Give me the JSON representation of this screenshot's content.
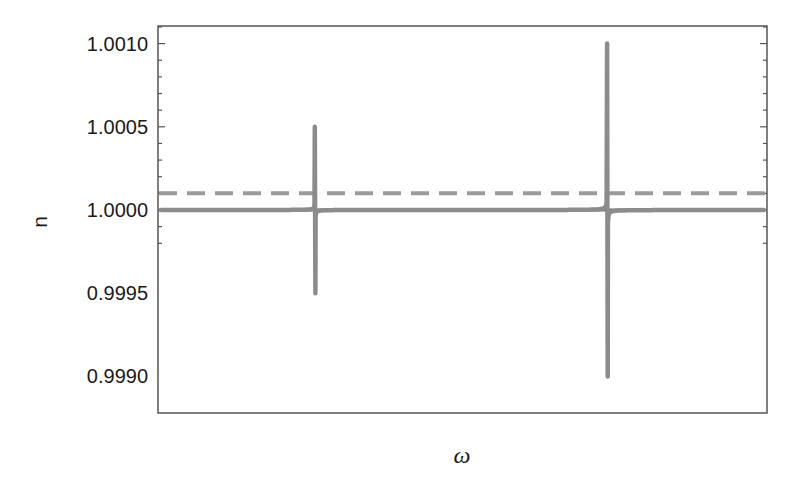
{
  "chart_data": {
    "type": "line",
    "title": "",
    "xlabel": "ω",
    "ylabel": "n",
    "ylim": [
      0.99976,
      1.00112
    ],
    "y_ticks": [
      {
        "value": 1.001,
        "label": "1.0010"
      },
      {
        "value": 1.0005,
        "label": "1.0005"
      },
      {
        "value": 1.0,
        "label": "1.0000"
      },
      {
        "value": 0.9995,
        "label": "0.9995"
      },
      {
        "value": 0.999,
        "label": "0.9990"
      }
    ],
    "x_ticks": [],
    "grid": false,
    "legend": null,
    "series": [
      {
        "name": "refractive index n(ω) with two resonances",
        "style": "solid-thick",
        "color": "#8c8c8c",
        "resonances": [
          {
            "x_fraction": 0.258,
            "peak": 1.0005,
            "trough": 0.9995
          },
          {
            "x_fraction": 0.738,
            "peak": 1.001,
            "trough": 0.999
          }
        ]
      },
      {
        "name": "n = 1 reference",
        "style": "solid",
        "color": "#6e6e6e",
        "value": 1.0
      },
      {
        "name": "threshold level",
        "style": "dashed",
        "color": "#999999",
        "value": 1.0001
      }
    ],
    "annotations": [
      "Shaded region between curve and dashed line just below second resonance peak"
    ]
  },
  "colors": {
    "curve": "#8c8c8c",
    "baseline": "#6e6e6e",
    "dashed": "#9a9a9a",
    "shade": "#e3e3e3",
    "frame": "#555555"
  }
}
